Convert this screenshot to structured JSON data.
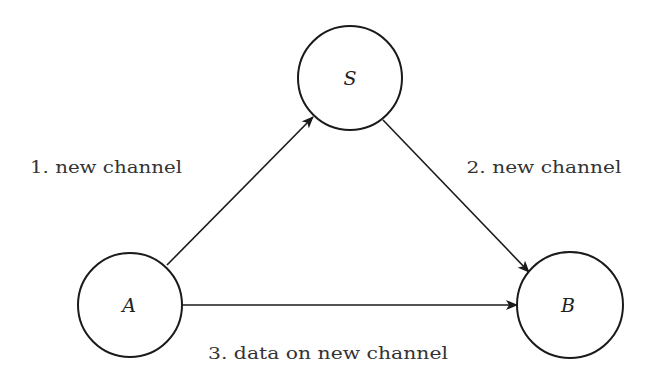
{
  "diagram": {
    "type": "directed-graph",
    "nodes": [
      {
        "id": "S",
        "label": "S",
        "cx": 350,
        "cy": 78,
        "r": 52
      },
      {
        "id": "A",
        "label": "A",
        "cx": 130,
        "cy": 305,
        "r": 52
      },
      {
        "id": "B",
        "label": "B",
        "cx": 570,
        "cy": 305,
        "r": 53
      }
    ],
    "edges": [
      {
        "from": "A",
        "to": "S",
        "label": "1. new channel"
      },
      {
        "from": "S",
        "to": "B",
        "label": "2. new channel"
      },
      {
        "from": "A",
        "to": "B",
        "label": "3. data on new channel"
      }
    ],
    "colors": {
      "stroke": "#1a1a1a",
      "text": "#333333",
      "background": "#ffffff"
    }
  }
}
